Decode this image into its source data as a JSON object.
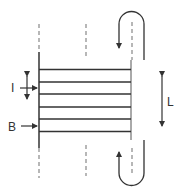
{
  "diagram": {
    "labels": {
      "current": "I",
      "field": "B",
      "length": "L"
    },
    "colors": {
      "stroke": "#333333",
      "dashed": "#888888",
      "background": "#ffffff"
    },
    "strip_count": 6
  }
}
